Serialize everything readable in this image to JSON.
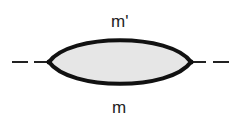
{
  "diagram": {
    "type": "feynman-loop",
    "top_label": "m'",
    "bottom_label": "m",
    "colors": {
      "line": "#111111",
      "fill": "#e6e6e6"
    }
  }
}
